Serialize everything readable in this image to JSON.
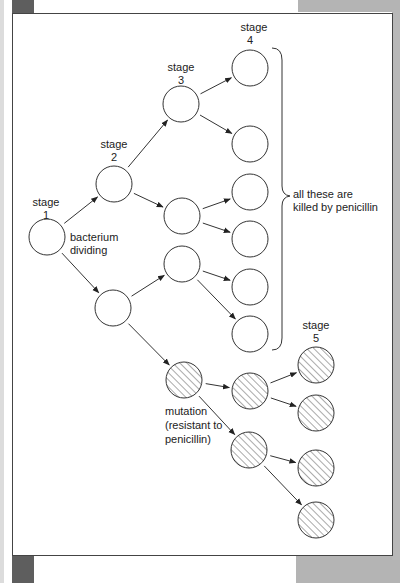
{
  "labels": {
    "stage1": [
      "stage",
      "1"
    ],
    "stage2": [
      "stage",
      "2"
    ],
    "stage3": [
      "stage",
      "3"
    ],
    "stage4": [
      "stage",
      "4"
    ],
    "stage5": [
      "stage",
      "5"
    ],
    "bacterium": [
      "bacterium",
      "dividing"
    ],
    "killed": [
      "all these are",
      "killed by penicillin"
    ],
    "mutation": [
      "mutation",
      "(resistant to",
      "penicillin)"
    ]
  },
  "colors": {
    "line": "#333333",
    "hatch": "#555555",
    "frame_border": "#444444"
  },
  "nodes": [
    {
      "id": "s1",
      "stage": 1,
      "x": 47,
      "y": 237,
      "resistant": false
    },
    {
      "id": "s2a",
      "stage": 2,
      "x": 114,
      "y": 184,
      "resistant": false
    },
    {
      "id": "s2b",
      "stage": 2,
      "x": 113,
      "y": 308,
      "resistant": false
    },
    {
      "id": "s3a",
      "stage": 3,
      "x": 181,
      "y": 104,
      "resistant": false
    },
    {
      "id": "s3b",
      "stage": 3,
      "x": 182,
      "y": 216,
      "resistant": false
    },
    {
      "id": "s3c",
      "stage": 3,
      "x": 182,
      "y": 264,
      "resistant": false
    },
    {
      "id": "s3m",
      "stage": 3,
      "x": 184,
      "y": 380,
      "resistant": true
    },
    {
      "id": "s4a",
      "stage": 4,
      "x": 250,
      "y": 68,
      "resistant": false
    },
    {
      "id": "s4b",
      "stage": 4,
      "x": 250,
      "y": 144,
      "resistant": false
    },
    {
      "id": "s4c",
      "stage": 4,
      "x": 250,
      "y": 192,
      "resistant": false
    },
    {
      "id": "s4d",
      "stage": 4,
      "x": 250,
      "y": 239,
      "resistant": false
    },
    {
      "id": "s4e",
      "stage": 4,
      "x": 250,
      "y": 287,
      "resistant": false
    },
    {
      "id": "s4f",
      "stage": 4,
      "x": 250,
      "y": 334,
      "resistant": false
    },
    {
      "id": "s4m1",
      "stage": 4,
      "x": 250,
      "y": 391,
      "resistant": true
    },
    {
      "id": "s4m2",
      "stage": 4,
      "x": 249,
      "y": 450,
      "resistant": true
    },
    {
      "id": "s5a",
      "stage": 5,
      "x": 316,
      "y": 365,
      "resistant": true
    },
    {
      "id": "s5b",
      "stage": 5,
      "x": 316,
      "y": 413,
      "resistant": true
    },
    {
      "id": "s5c",
      "stage": 5,
      "x": 316,
      "y": 468,
      "resistant": true
    },
    {
      "id": "s5d",
      "stage": 5,
      "x": 316,
      "y": 520,
      "resistant": true
    }
  ],
  "edges": [
    [
      "s1",
      "s2a"
    ],
    [
      "s1",
      "s2b"
    ],
    [
      "s2a",
      "s3a"
    ],
    [
      "s2a",
      "s3b"
    ],
    [
      "s2b",
      "s3c"
    ],
    [
      "s2b",
      "s3m"
    ],
    [
      "s3a",
      "s4a"
    ],
    [
      "s3a",
      "s4b"
    ],
    [
      "s3b",
      "s4c"
    ],
    [
      "s3b",
      "s4d"
    ],
    [
      "s3c",
      "s4e"
    ],
    [
      "s3c",
      "s4f"
    ],
    [
      "s3m",
      "s4m1"
    ],
    [
      "s3m",
      "s4m2"
    ],
    [
      "s4m1",
      "s5a"
    ],
    [
      "s4m1",
      "s5b"
    ],
    [
      "s4m2",
      "s5c"
    ],
    [
      "s4m2",
      "s5d"
    ]
  ]
}
